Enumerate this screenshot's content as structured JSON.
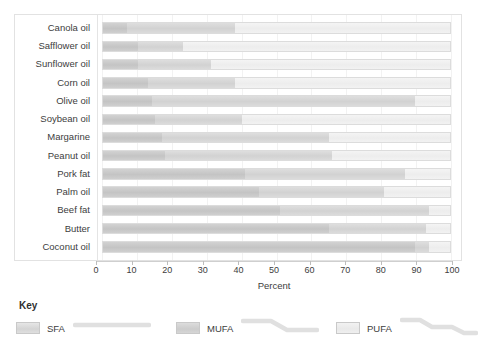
{
  "chart_data": {
    "type": "bar",
    "orientation": "horizontal",
    "stacked": true,
    "title": "",
    "xlabel": "Percent",
    "ylabel": "",
    "xlim": [
      0,
      100
    ],
    "xticks": [
      0,
      10,
      20,
      30,
      40,
      50,
      60,
      70,
      80,
      90,
      100
    ],
    "xtick_labels": [
      "0",
      "10",
      "20",
      "30",
      "40",
      "50",
      "60",
      "70",
      "80",
      "90",
      "100"
    ],
    "grid": true,
    "legend_position": "bottom",
    "legend_title": "Key",
    "categories": [
      "Canola oil",
      "Safflower oil",
      "Sunflower oil",
      "Corn oil",
      "Olive oil",
      "Soybean oil",
      "Margarine",
      "Peanut oil",
      "Pork fat",
      "Palm oil",
      "Beef fat",
      "Butter",
      "Coconut oil"
    ],
    "series": [
      {
        "name": "SFA",
        "color": "#c8c8c8",
        "values": [
          7,
          10,
          10,
          13,
          14,
          15,
          17,
          18,
          41,
          45,
          51,
          65,
          90
        ]
      },
      {
        "name": "MUFA",
        "color": "#d6d6d6",
        "values": [
          31,
          13,
          21,
          25,
          76,
          25,
          48,
          48,
          46,
          36,
          43,
          28,
          4
        ]
      },
      {
        "name": "PUFA",
        "color": "#f0f0f0",
        "values": [
          62,
          77,
          69,
          62,
          10,
          60,
          35,
          34,
          13,
          19,
          6,
          7,
          6
        ]
      }
    ]
  },
  "legend": {
    "title": "Key",
    "entries": [
      {
        "label": "SFA",
        "chain": "straight",
        "color": "#d6d6d6"
      },
      {
        "label": "MUFA",
        "chain": "one-bend",
        "color": "#cfcfcf"
      },
      {
        "label": "PUFA",
        "chain": "two-bend",
        "color": "#eeeeee"
      }
    ]
  },
  "axis": {
    "title": "Percent"
  }
}
